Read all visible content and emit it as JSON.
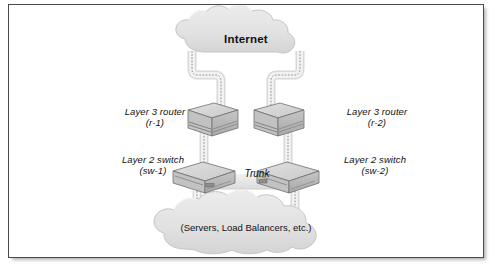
{
  "figure": {
    "border_color": "#4a4a4a",
    "background_color": "#ffffff"
  },
  "clouds": [
    {
      "id": "internet-cloud",
      "label": "Internet",
      "bold": true,
      "italic": false,
      "position": "top"
    },
    {
      "id": "servers-cloud",
      "label": "(Servers, Load Balancers, etc.)",
      "bold": false,
      "italic": false,
      "position": "bottom"
    }
  ],
  "devices": [
    {
      "id": "router-left",
      "type": "layer-3-router",
      "label_line1": "Layer 3 router",
      "label_line2": "(r-1)",
      "side": "left"
    },
    {
      "id": "router-right",
      "type": "layer-3-router",
      "label_line1": "Layer 3 router",
      "label_line2": "(r-2)",
      "side": "right"
    },
    {
      "id": "switch-left",
      "type": "layer-2-switch",
      "label_line1": "Layer 2 switch",
      "label_line2": "(sw-1)",
      "side": "left"
    },
    {
      "id": "switch-right",
      "type": "layer-2-switch",
      "label_line1": "Layer 2 switch",
      "label_line2": "(sw-2)",
      "side": "right"
    }
  ],
  "links": [
    {
      "id": "link-internet-r1",
      "from": "internet-cloud",
      "to": "router-left",
      "label": ""
    },
    {
      "id": "link-internet-r2",
      "from": "internet-cloud",
      "to": "router-right",
      "label": ""
    },
    {
      "id": "link-r1-sw1",
      "from": "router-left",
      "to": "switch-left",
      "label": ""
    },
    {
      "id": "link-r2-sw2",
      "from": "router-right",
      "to": "switch-right",
      "label": ""
    },
    {
      "id": "link-trunk",
      "from": "switch-left",
      "to": "switch-right",
      "label": "Trunk"
    },
    {
      "id": "link-sw1-servers",
      "from": "switch-left",
      "to": "servers-cloud",
      "label": ""
    },
    {
      "id": "link-sw2-servers",
      "from": "switch-right",
      "to": "servers-cloud",
      "label": ""
    }
  ],
  "colors": {
    "cloud_fill": "#e2e2e2",
    "cloud_stroke": "#c7c7c7",
    "link_fill": "#e6e6e6",
    "link_stroke": "#d2d2d2",
    "link_dash": "#8f8f8f",
    "device_top": "#d7d7d7",
    "device_front": "#b8b8b8",
    "device_side": "#9e9e9e",
    "device_stroke": "#6e6e6e",
    "text": "#111111"
  }
}
